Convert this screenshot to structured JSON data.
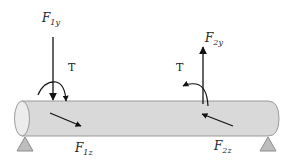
{
  "diagram": {
    "labels": {
      "f1y": {
        "main": "F",
        "sub": "1y"
      },
      "f1z": {
        "main": "F",
        "sub": "1z"
      },
      "f2y": {
        "main": "F",
        "sub": "2y"
      },
      "f2z": {
        "main": "F",
        "sub": "2z"
      },
      "torque_left": "T",
      "torque_right": "T"
    },
    "colors": {
      "beam_fill": "#d9d9d9",
      "beam_stroke": "#9a9a9a",
      "end_cap_fill": "#ececec",
      "support_fill": "#bdbdbd",
      "support_stroke": "#8c8c8c",
      "arrow": "#111111"
    }
  }
}
